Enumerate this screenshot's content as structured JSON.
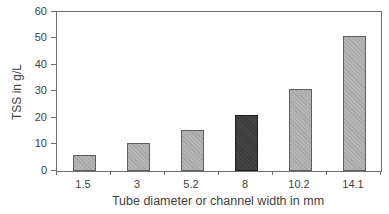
{
  "chart_data": {
    "type": "bar",
    "title": "",
    "xlabel": "Tube diameter or channel width in mm",
    "ylabel": "TSS in g/L",
    "categories": [
      "1.5",
      "3",
      "5.2",
      "8",
      "10.2",
      "14.1"
    ],
    "values": [
      6,
      10.5,
      15.5,
      21,
      31,
      51
    ],
    "ylim": [
      0,
      60
    ],
    "yticks": [
      0,
      10,
      20,
      30,
      40,
      50,
      60
    ],
    "grid": false,
    "legend": false,
    "highlight_index": 3,
    "highlight_category": "8",
    "colors": {
      "bar_fill": "#b4b4b4",
      "bar_border": "#5f5f5f",
      "highlight_fill": "#3d3d3d",
      "highlight_border": "#1f1f1f",
      "axis": "#6f6f6f",
      "text": "#3f3f3f",
      "background": "#ffffff"
    }
  }
}
